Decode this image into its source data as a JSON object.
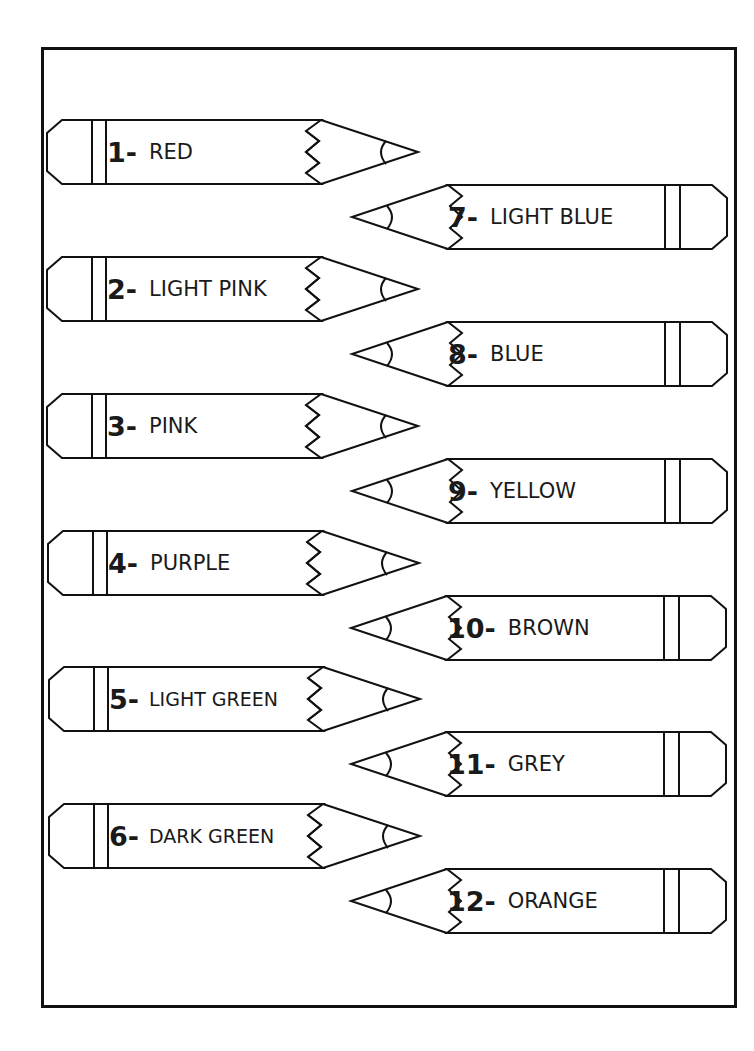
{
  "worksheet": {
    "title": "",
    "pencils": [
      {
        "number": "1-",
        "color_name": "RED",
        "side": "left"
      },
      {
        "number": "2-",
        "color_name": "LIGHT PINK",
        "side": "left"
      },
      {
        "number": "3-",
        "color_name": "PINK",
        "side": "left"
      },
      {
        "number": "4-",
        "color_name": "PURPLE",
        "side": "left"
      },
      {
        "number": "5-",
        "color_name": "LIGHT GREEN",
        "side": "left"
      },
      {
        "number": "6-",
        "color_name": "DARK GREEN",
        "side": "left"
      },
      {
        "number": "7-",
        "color_name": "LIGHT BLUE",
        "side": "right"
      },
      {
        "number": "8-",
        "color_name": "BLUE",
        "side": "right"
      },
      {
        "number": "9-",
        "color_name": "YELLOW",
        "side": "right"
      },
      {
        "number": "10-",
        "color_name": "BROWN",
        "side": "right"
      },
      {
        "number": "11-",
        "color_name": "GREY",
        "side": "right"
      },
      {
        "number": "12-",
        "color_name": "ORANGE",
        "side": "right"
      }
    ]
  },
  "colors": {
    "outline": "#111111",
    "background": "#ffffff"
  }
}
